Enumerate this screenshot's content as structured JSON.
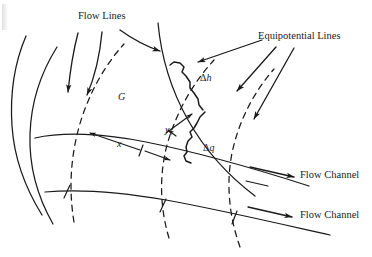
{
  "figure": {
    "type": "flow-net-diagram",
    "background_color": "#ffffff",
    "ink_color": "#1a1a1a",
    "width": 372,
    "height": 257
  },
  "labels": {
    "flow_lines": "Flow Lines",
    "equipotential_lines": "Equipotential Lines",
    "flow_channel_upper": "Flow Channel",
    "flow_channel_lower": "Flow Channel",
    "field_G": "G",
    "dim_x": "x",
    "dim_y": "y",
    "delta_h": "Δh",
    "delta_h_symbol": "Δ",
    "delta_h_var": "h",
    "delta_q": "Δq",
    "delta_q_symbol": "Δ",
    "delta_q_var": "q"
  },
  "annotations": {
    "leader_count_flow_lines": 3,
    "leader_count_equipotential": 3,
    "leader_count_flow_channel": 2,
    "dimension_arrows": [
      "x",
      "y"
    ]
  },
  "legend": {
    "solid_curve_meaning": "Flow Lines",
    "dashed_curve_meaning": "Equipotential Lines"
  }
}
